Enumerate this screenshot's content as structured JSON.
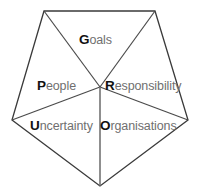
{
  "diagram": {
    "type": "pentagon-segmented-wheel",
    "title": "",
    "background_color": "#ffffff",
    "outline_color": "#3a3a3a",
    "spoke_color": "#5a5a5a",
    "initial_letter_color": "#111111",
    "label_text_color": "#6f6f6f",
    "geometry": {
      "center": {
        "x": 100,
        "y": 87
      },
      "vertices": [
        {
          "name": "top-left",
          "x": 44,
          "y": 11
        },
        {
          "name": "top-right",
          "x": 155,
          "y": 11
        },
        {
          "name": "right",
          "x": 188,
          "y": 120
        },
        {
          "name": "bottom",
          "x": 100,
          "y": 186
        },
        {
          "name": "left",
          "x": 12,
          "y": 120
        }
      ]
    },
    "sectors": [
      {
        "id": "goals",
        "initial": "G",
        "rest": "oals",
        "full_label": "Goals",
        "position": "top"
      },
      {
        "id": "people",
        "initial": "P",
        "rest": "eople",
        "full_label": "People",
        "position": "upper-left"
      },
      {
        "id": "responsibility",
        "initial": "R",
        "rest": "esponsibility",
        "full_label": "Responsibility",
        "position": "upper-right"
      },
      {
        "id": "uncertainty",
        "initial": "U",
        "rest": "ncertainty",
        "full_label": "Uncertainty",
        "position": "lower-left"
      },
      {
        "id": "organisations",
        "initial": "O",
        "rest": "rganisations",
        "full_label": "Organisations",
        "position": "lower-right"
      }
    ]
  }
}
